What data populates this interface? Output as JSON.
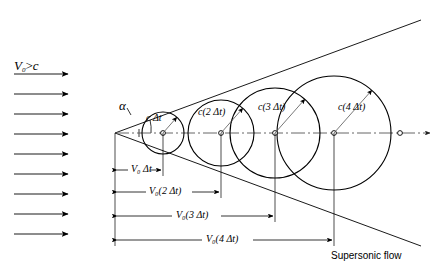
{
  "figure": {
    "kind": "supersonic-mach-cone-diagram",
    "caption": "Supersonic flow",
    "stroke_color": "#000000",
    "axis_color": "#555555",
    "background": "#ffffff"
  },
  "freestream": {
    "label_html": "V<sub>0</sub> &gt; c",
    "label_v": "V",
    "label_sub": "0",
    "label_rel": ">",
    "label_c": "c",
    "arrow_count": 9,
    "arrow_x_start": 14,
    "arrow_x_end": 70,
    "arrow_y_first": 74,
    "arrow_spacing": 20
  },
  "angle": {
    "symbol": "α",
    "x": 120,
    "y": 106
  },
  "apex": {
    "x": 115,
    "y": 133
  },
  "wavefronts": [
    {
      "id": 1,
      "label_c": "c",
      "label_arg": "Δt",
      "label_paren": false,
      "label_text": "c Δt",
      "cx": 163,
      "cy": 133,
      "r": 21,
      "radius_angle_deg": -48
    },
    {
      "id": 2,
      "label_c": "c",
      "label_arg": "2 Δt",
      "label_paren": true,
      "label_text": "c(2 Δt)",
      "cx": 221,
      "cy": 133,
      "r": 33,
      "radius_angle_deg": -48
    },
    {
      "id": 3,
      "label_c": "c",
      "label_arg": "3 Δt",
      "label_paren": true,
      "label_text": "c(3 Δt)",
      "cx": 275,
      "cy": 133,
      "r": 45,
      "radius_angle_deg": -48
    },
    {
      "id": 4,
      "label_c": "c",
      "label_arg": "4 Δt",
      "label_paren": true,
      "label_text": "c(4 Δt)",
      "cx": 334,
      "cy": 133,
      "r": 57,
      "radius_angle_deg": -48
    }
  ],
  "dimensions": [
    {
      "id": 1,
      "label_text": "V₀ Δt",
      "v": "V",
      "sub": "0",
      "arg": "Δt",
      "paren": false,
      "x1": 115,
      "x2": 163,
      "y": 170
    },
    {
      "id": 2,
      "label_text": "V₀(2 Δt)",
      "v": "V",
      "sub": "0",
      "arg": "2 Δt",
      "paren": true,
      "x1": 115,
      "x2": 221,
      "y": 192
    },
    {
      "id": 3,
      "label_text": "V₀(3 Δt)",
      "v": "V",
      "sub": "0",
      "arg": "3 Δt",
      "paren": true,
      "x1": 115,
      "x2": 275,
      "y": 216
    },
    {
      "id": 4,
      "label_text": "V₀(4 Δt)",
      "v": "V",
      "sub": "0",
      "arg": "4 Δt",
      "paren": true,
      "x1": 115,
      "x2": 334,
      "y": 240
    }
  ],
  "mach_lines": {
    "upper_end": {
      "x": 421,
      "y": 20
    },
    "lower_end": {
      "x": 421,
      "y": 246
    }
  },
  "axis": {
    "x1": 115,
    "x2": 436,
    "y": 133
  }
}
